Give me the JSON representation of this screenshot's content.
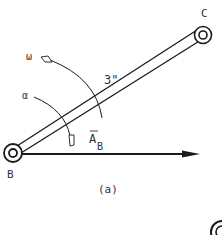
{
  "figure": {
    "caption": "(a)",
    "points": {
      "B": "B",
      "C": "C"
    },
    "link_length": "3\"",
    "angular_velocity": "ω",
    "angular_acceleration": "α",
    "acceleration_vector": {
      "symbol": "A",
      "subscript": "B"
    },
    "colors": {
      "ink": "#1a1a1a",
      "background": "#ffffff"
    }
  }
}
